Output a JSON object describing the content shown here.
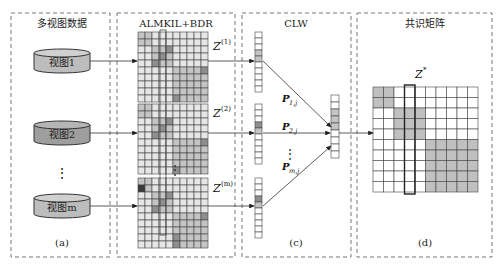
{
  "panels": [
    {
      "id": "a",
      "title": "多视图数据",
      "caption": "(a)"
    },
    {
      "id": "b",
      "title": "ALMKIL+BDR",
      "caption": "(b)"
    },
    {
      "id": "c",
      "title": "CLW",
      "caption": "(c)"
    },
    {
      "id": "d",
      "title": "共识矩阵",
      "caption": "(d)"
    }
  ],
  "views": [
    {
      "label": "视图1"
    },
    {
      "label": "视图2"
    },
    {
      "label": "视图m"
    }
  ],
  "matrices": [
    {
      "name": "Z",
      "sup": "(1)"
    },
    {
      "name": "Z",
      "sup": "(2)"
    },
    {
      "name": "Z",
      "sup": "(m)"
    }
  ],
  "weights": [
    {
      "name": "P",
      "sub": "1,j"
    },
    {
      "name": "P",
      "sub": "2,j"
    },
    {
      "name": "P",
      "sub": "m,j"
    }
  ],
  "consensus": {
    "name": "Z",
    "sup": "*"
  },
  "ellipsis": "⋮",
  "colors": {
    "border": "#777777",
    "cylinder_fill": "#bdbdbd",
    "cylinder_top": "#d0d0d0",
    "cell_light": "#e6e6e6",
    "cell_mid": "#c4c4c4",
    "cell_dark": "#8f8f8f",
    "cell_black": "#3a3a3a",
    "consensus_fill": "#c0c0c0"
  }
}
